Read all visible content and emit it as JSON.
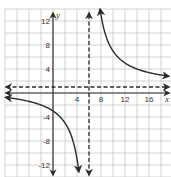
{
  "chart_data": {
    "type": "line",
    "title": "",
    "function": "y = 24/(x - 6) + 1",
    "xlabel": "x",
    "ylabel": "y",
    "xlim": [
      -8,
      19.5
    ],
    "ylim": [
      -14,
      14
    ],
    "grid": true,
    "grid_step": 2,
    "x_ticks": [
      {
        "value": 4,
        "label": "4"
      },
      {
        "value": 8,
        "label": "8"
      },
      {
        "value": 12,
        "label": "12"
      },
      {
        "value": 16,
        "label": "16"
      }
    ],
    "y_ticks": [
      {
        "value": 12,
        "label": "12"
      },
      {
        "value": 8,
        "label": "8"
      },
      {
        "value": 4,
        "label": "4"
      },
      {
        "value": -4,
        "label": "-4"
      },
      {
        "value": -8,
        "label": "-8"
      },
      {
        "value": -12,
        "label": "-12"
      }
    ],
    "asymptotes": [
      {
        "type": "vertical",
        "x": 6,
        "style": "dashed"
      },
      {
        "type": "horizontal",
        "y": 1,
        "style": "dashed"
      }
    ],
    "series": [
      {
        "name": "right-branch",
        "points": [
          [
            8,
            13
          ],
          [
            9,
            9
          ],
          [
            10,
            7
          ],
          [
            12,
            5
          ],
          [
            14,
            4
          ],
          [
            16,
            3.4
          ],
          [
            18,
            3
          ]
        ]
      },
      {
        "name": "left-branch",
        "points": [
          [
            -8,
            -0.71
          ],
          [
            -6,
            -1
          ],
          [
            -4,
            -1.4
          ],
          [
            -2,
            -2
          ],
          [
            0,
            -3
          ],
          [
            2,
            -5
          ],
          [
            3,
            -7
          ],
          [
            4,
            -11
          ],
          [
            4.3,
            -13.1
          ]
        ]
      }
    ],
    "colors": {
      "grid": "#c8c8c8",
      "axis": "#333333",
      "curve": "#2b2b2b",
      "asymptote": "#2b2b2b"
    }
  }
}
